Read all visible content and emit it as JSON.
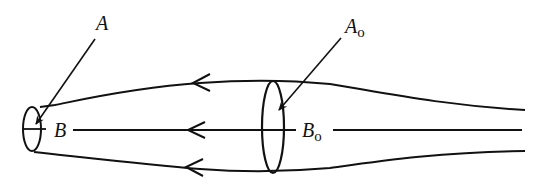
{
  "diagram": {
    "labels": {
      "A": "A",
      "A0_main": "A",
      "A0_sub": "o",
      "B": "B",
      "B0_main": "B",
      "B0_sub": "o"
    },
    "elements": {
      "small_cross_section": "A",
      "large_cross_section": "A_o",
      "centerline_points": [
        "B",
        "B_o"
      ],
      "flow_direction": "right-to-left",
      "streamlines": [
        "top",
        "center",
        "bottom"
      ]
    },
    "colors": {
      "stroke": "#111111",
      "background": "#ffffff"
    }
  }
}
